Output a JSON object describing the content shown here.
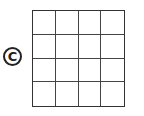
{
  "label": "C",
  "grid": {
    "rows": 4,
    "cols": 4
  }
}
